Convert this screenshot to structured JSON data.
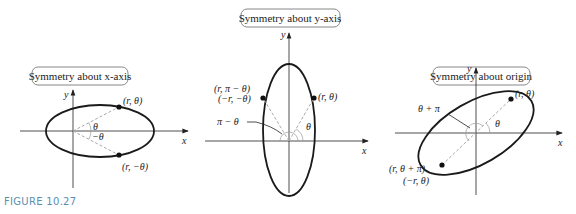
{
  "figure_label": "FIGURE 10.27",
  "colors": {
    "caption": "#5a8fb0",
    "curve": "#1a1a1a",
    "dashed": "#aaaaaa",
    "box_border": "#888888"
  },
  "panels": [
    {
      "title": "Symmetry about x-axis",
      "axes": {
        "x": "x",
        "y": "y"
      },
      "points": [
        "(r, θ)",
        "(r, −θ)"
      ],
      "angles": [
        "θ",
        "−θ"
      ]
    },
    {
      "title": "Symmetry about y-axis",
      "axes": {
        "x": "x",
        "y": "y"
      },
      "points": [
        "(r, θ)",
        "(r, π − θ)",
        "(−r, −θ)"
      ],
      "angles": [
        "θ",
        "π − θ"
      ]
    },
    {
      "title": "Symmetry about origin",
      "axes": {
        "x": "x",
        "y": "y"
      },
      "points": [
        "(r, θ)",
        "(r, θ + π)",
        "(−r, θ)"
      ],
      "angles": [
        "θ",
        "θ + π"
      ]
    }
  ]
}
